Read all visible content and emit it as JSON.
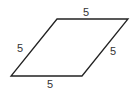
{
  "figure": {
    "shape": "rhombus",
    "stroke_color": "#222222",
    "vertices": [
      [
        57,
        19
      ],
      [
        128,
        19
      ],
      [
        82,
        76
      ],
      [
        11,
        76
      ]
    ],
    "labels": {
      "top": "5",
      "right": "5",
      "bottom": "5",
      "left": "5"
    }
  }
}
